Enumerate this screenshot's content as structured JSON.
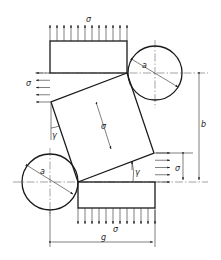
{
  "diagram": {
    "title": "",
    "labels": {
      "stress_top": "σ",
      "stress_left": "σ",
      "stress_center": "σ",
      "stress_right": "σ",
      "stress_bottom": "σ",
      "circle_top_diameter": "a",
      "circle_bottom_diameter": "a",
      "angle_left": "γ",
      "angle_right": "γ",
      "dimension_height": "b",
      "dimension_width": "g"
    },
    "counts": {
      "top_arrows": 12,
      "bottom_arrows": 12,
      "left_arrows": 5,
      "right_arrows": 5
    }
  }
}
